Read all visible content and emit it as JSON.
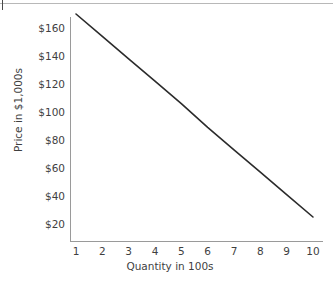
{
  "page": {
    "background_color": "#ffffff",
    "rule_color": "#b8b8b8",
    "axis_color": "#9a9a9a",
    "text_color": "#3f3f3f",
    "line_color": "#2b2b2b"
  },
  "chart_data": {
    "type": "line",
    "title": "",
    "subtitle": "",
    "xlabel": "Quantity in 100s",
    "ylabel": "Price in $1,000s",
    "xlim": [
      0.6,
      10.5
    ],
    "ylim": [
      10,
      180
    ],
    "grid": false,
    "legend": null,
    "x_tick_labels": [
      "1",
      "2",
      "3",
      "4",
      "5",
      "6",
      "7",
      "8",
      "9",
      "10"
    ],
    "x_tick_values": [
      1,
      2,
      3,
      4,
      5,
      6,
      7,
      8,
      9,
      10
    ],
    "y_tick_labels": [
      "$160",
      "$140",
      "$120",
      "$100",
      "$80",
      "$60",
      "$40",
      "$20"
    ],
    "y_tick_values": [
      160,
      140,
      120,
      100,
      80,
      60,
      40,
      20
    ],
    "series": [
      {
        "name": "Demand",
        "x": [
          1,
          2,
          3,
          4,
          5,
          6,
          7,
          8,
          9,
          10
        ],
        "values": [
          170,
          154,
          138,
          122,
          106,
          89,
          73,
          57,
          41,
          25
        ]
      }
    ],
    "annotations": []
  }
}
